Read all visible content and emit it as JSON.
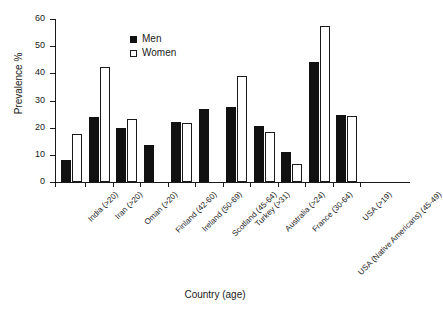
{
  "chart_data": {
    "type": "bar",
    "title": "",
    "xlabel": "Country (age)",
    "ylabel": "Prevalence %",
    "ylim": [
      0,
      60
    ],
    "yticks": [
      0,
      10,
      20,
      30,
      40,
      50,
      60
    ],
    "grid": false,
    "legend_position": "top-center",
    "categories": [
      "India (>20)",
      "Iran (>20)",
      "Oman (>20)",
      "Finland (42-60)",
      "Ireland (50-69)",
      "Scotland (45-64)",
      "Turkey (>31)",
      "Australia (>24)",
      "France (30-64)",
      "USA (Native Americans) (45-49)",
      "USA (>19)"
    ],
    "series": [
      {
        "name": "Men",
        "color": "#111111",
        "values": [
          8.0,
          24.0,
          19.7,
          13.8,
          22.0,
          26.8,
          27.5,
          20.5,
          11.0,
          44.3,
          24.5
        ]
      },
      {
        "name": "Women",
        "color": "#ffffff",
        "values": [
          17.5,
          42.5,
          23.3,
          null,
          21.7,
          null,
          39.0,
          18.5,
          6.5,
          57.5,
          24.3
        ]
      }
    ]
  },
  "legend": {
    "items": [
      {
        "label": "Men",
        "marker": "filled-square"
      },
      {
        "label": "Women",
        "marker": "open-square"
      }
    ]
  }
}
